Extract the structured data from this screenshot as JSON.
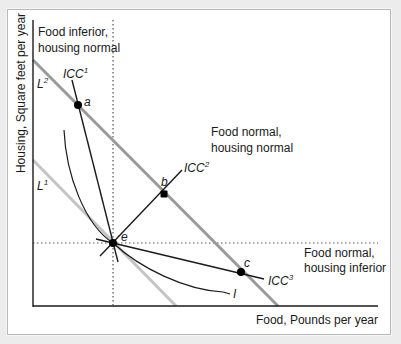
{
  "figure": {
    "y_axis_label": "Housing, Square feet per year",
    "x_axis_label": "Food, Pounds per year",
    "regions": {
      "top_left": [
        "Food inferior,",
        "housing normal"
      ],
      "top_right": [
        "Food normal,",
        "housing normal"
      ],
      "bottom_right": [
        "Food normal,",
        "housing inferior"
      ]
    },
    "budget_lines": [
      {
        "name": "L",
        "sup": "2",
        "color": "#9a9a9a"
      },
      {
        "name": "L",
        "sup": "1",
        "color": "#c4c4c4"
      }
    ],
    "icc_lines": [
      {
        "name": "ICC",
        "sup": "1"
      },
      {
        "name": "ICC",
        "sup": "2"
      },
      {
        "name": "ICC",
        "sup": "3"
      }
    ],
    "indifference_curve": {
      "name": "I"
    },
    "points": {
      "a": "a",
      "b": "b",
      "c": "c",
      "e": "e"
    },
    "colors": {
      "axis": "#1a1a1a",
      "L2": "#9a9a9a",
      "L1": "#c4c4c4",
      "icc": "#1a1a1a",
      "dotted": "#555555",
      "frame": "#b8b8b8",
      "background": "#ececec"
    }
  }
}
